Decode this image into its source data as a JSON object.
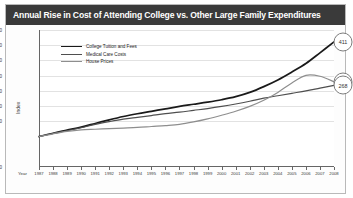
{
  "title": "Annual Rise in Cost of Attending College vs. Other Large Family Expenditures",
  "axis": {
    "ylabel": "Index",
    "xlabel": "Year"
  },
  "legend": [
    {
      "label": "College Tuition and Fees",
      "color": "#1a1a1a"
    },
    {
      "label": "Medical Care Costs",
      "color": "#4f4f4f"
    },
    {
      "label": "House Prices",
      "color": "#8e8e8e"
    }
  ],
  "endpoints": [
    {
      "label": "411",
      "series": "College Tuition and Fees"
    },
    {
      "label": "280",
      "series": "House Prices"
    },
    {
      "label": "268",
      "series": "Medical Care Costs"
    }
  ],
  "chart_data": {
    "type": "line",
    "title": "Annual Rise in Cost of Attending College vs. Other Large Family Expenditures",
    "xlabel": "Year",
    "ylabel": "Index",
    "ylim": [
      0,
      450
    ],
    "yticks": [
      0,
      150,
      200,
      250,
      300,
      350,
      400,
      450
    ],
    "ytick_labels": [
      "0",
      "150",
      "200",
      "250",
      "300",
      "350",
      "400",
      "450"
    ],
    "grid": true,
    "legend_position": "top-left",
    "categories": [
      1987,
      1988,
      1989,
      1990,
      1991,
      1992,
      1993,
      1994,
      1995,
      1996,
      1997,
      1998,
      1999,
      2000,
      2001,
      2002,
      2003,
      2004,
      2005,
      2006,
      2007,
      2008
    ],
    "series": [
      {
        "name": "College Tuition and Fees",
        "color": "#1a1a1a",
        "values": [
          100,
          111,
          121,
          131,
          143,
          155,
          166,
          175,
          183,
          191,
          199,
          206,
          213,
          221,
          231,
          245,
          264,
          286,
          312,
          340,
          375,
          411
        ]
      },
      {
        "name": "Medical Care Costs",
        "color": "#4f4f4f",
        "values": [
          100,
          110,
          119,
          129,
          140,
          149,
          157,
          163,
          169,
          175,
          180,
          186,
          192,
          199,
          207,
          216,
          226,
          234,
          242,
          250,
          259,
          268
        ]
      },
      {
        "name": "House Prices",
        "color": "#8e8e8e",
        "values": [
          100,
          109,
          117,
          122,
          124,
          126,
          128,
          130,
          133,
          136,
          140,
          148,
          158,
          170,
          183,
          199,
          219,
          245,
          276,
          301,
          298,
          280
        ]
      }
    ]
  }
}
